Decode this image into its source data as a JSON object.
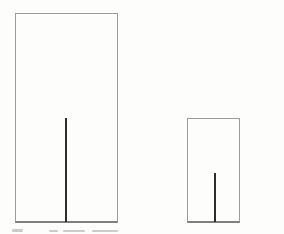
{
  "figure": {
    "background_color": "#fdfdfc",
    "frame_border_color": "#9c9c9c",
    "frame_bottom_border_color": "#7f7f7f",
    "line_color": "#2e2e2e",
    "line_width": 2,
    "frames": [
      {
        "name": "large-frame",
        "x": 15,
        "y": 13,
        "width": 103,
        "height": 210,
        "line": {
          "x": 65,
          "top": 118,
          "bottom": 222
        }
      },
      {
        "name": "small-frame",
        "x": 187,
        "y": 118,
        "width": 53,
        "height": 105,
        "line": {
          "x": 214,
          "top": 173,
          "bottom": 222
        }
      }
    ],
    "caption_remnant": {
      "color": "#bfbfbf",
      "marks": [
        {
          "x": 12,
          "y": 229,
          "width": 11,
          "height": 3
        },
        {
          "x": 49,
          "y": 230,
          "width": 9,
          "height": 2
        },
        {
          "x": 63,
          "y": 230,
          "width": 22,
          "height": 2
        },
        {
          "x": 92,
          "y": 230,
          "width": 26,
          "height": 2
        }
      ]
    }
  }
}
